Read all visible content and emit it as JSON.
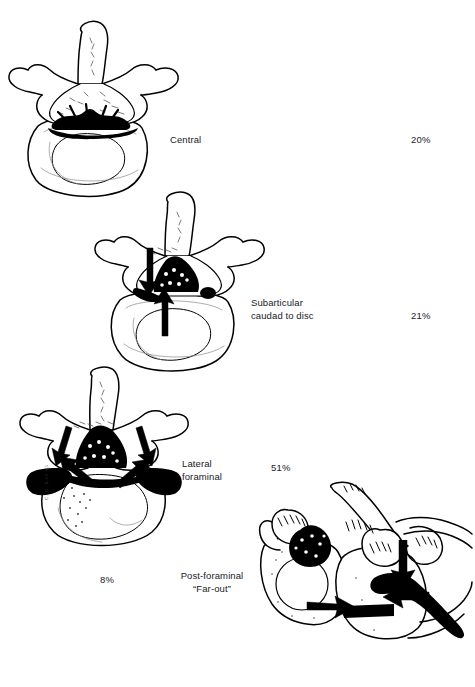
{
  "figure": {
    "background_color": "#ffffff",
    "ink_color": "#000000"
  },
  "items": [
    {
      "id": "central",
      "label": "Central",
      "percent": "20%",
      "view": "axial lumbar vertebra, superior view",
      "herniation": "central posterior disc protrusion at midline"
    },
    {
      "id": "subarticular",
      "label": "Subarticular\ncaudad to disc",
      "percent": "21%",
      "view": "axial lumbar vertebra, superior view",
      "herniation": "left subarticular protrusion caudad to the disc"
    },
    {
      "id": "lateral-foraminal",
      "label": "Lateral\nforaminal",
      "percent": "51%",
      "view": "axial lumbar vertebra, superior view",
      "herniation": "bilateral lateral foraminal protrusion"
    },
    {
      "id": "post-foraminal",
      "label": "Post-foraminal\n“Far-out”",
      "percent": "8%",
      "view": "oblique lumbosacral junction",
      "herniation": "extraforaminal far-out compression lateral to the foramen"
    }
  ],
  "annotations": {
    "nerve_root": "N5",
    "artist_signature": "C. O. BAY 85"
  }
}
